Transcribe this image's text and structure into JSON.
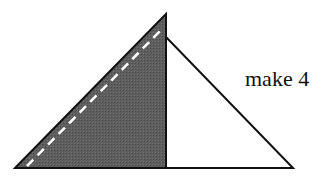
{
  "diagram": {
    "label": "make 4",
    "colors": {
      "shaded": "#5a5a5a",
      "stroke": "#111111",
      "dash": "#ffffff",
      "fill_light": "#ffffff"
    }
  }
}
